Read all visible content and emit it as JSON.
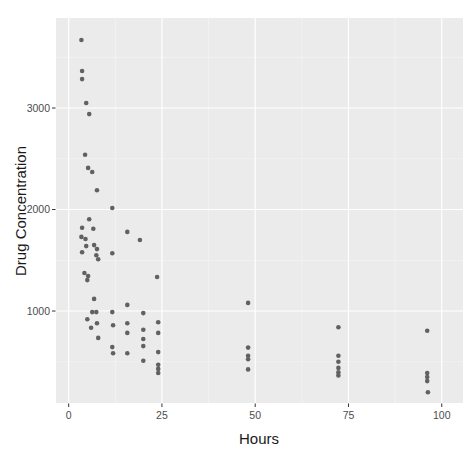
{
  "figure": {
    "background_color": "#ffffff"
  },
  "chart_data": {
    "type": "scatter",
    "title": "",
    "xlabel": "Hours",
    "ylabel": "Drug Concentration",
    "x_ticks": [
      0,
      25,
      50,
      75,
      100
    ],
    "y_ticks": [
      1000,
      2000,
      3000
    ],
    "xlim": [
      -3.4,
      105.7
    ],
    "ylim": [
      94,
      3887
    ],
    "grid": "major-and-minor",
    "legend": "none",
    "panel_bg": "#ebebeb",
    "grid_major_color": "#ffffff",
    "grid_minor_color": "#f7f7f7",
    "point_color": "#616161",
    "point_radius": 2.3,
    "tick_color": "#333333",
    "tick_label_color": "#4d4d4d",
    "axis_title_color": "#1a1a1a",
    "points": [
      [
        3.4,
        3670
      ],
      [
        3.6,
        3365
      ],
      [
        3.6,
        3285
      ],
      [
        4.7,
        3050
      ],
      [
        5.5,
        2940
      ],
      [
        4.4,
        2540
      ],
      [
        5.2,
        2410
      ],
      [
        6.3,
        2370
      ],
      [
        7.6,
        2190
      ],
      [
        11.7,
        2015
      ],
      [
        5.5,
        1905
      ],
      [
        3.6,
        1820
      ],
      [
        6.6,
        1810
      ],
      [
        3.4,
        1730
      ],
      [
        4.5,
        1710
      ],
      [
        15.7,
        1780
      ],
      [
        19.1,
        1700
      ],
      [
        4.7,
        1640
      ],
      [
        6.8,
        1650
      ],
      [
        3.6,
        1580
      ],
      [
        7.6,
        1610
      ],
      [
        7.4,
        1550
      ],
      [
        7.9,
        1510
      ],
      [
        11.7,
        1570
      ],
      [
        4.2,
        1375
      ],
      [
        5.2,
        1345
      ],
      [
        5.0,
        1305
      ],
      [
        23.7,
        1335
      ],
      [
        6.8,
        1120
      ],
      [
        15.7,
        1060
      ],
      [
        6.3,
        990
      ],
      [
        7.4,
        990
      ],
      [
        11.7,
        990
      ],
      [
        20.0,
        980
      ],
      [
        5.0,
        920
      ],
      [
        7.6,
        880
      ],
      [
        6.0,
        835
      ],
      [
        11.9,
        860
      ],
      [
        15.7,
        880
      ],
      [
        24.0,
        890
      ],
      [
        7.9,
        735
      ],
      [
        15.7,
        785
      ],
      [
        20.0,
        815
      ],
      [
        24.0,
        785
      ],
      [
        11.7,
        645
      ],
      [
        11.9,
        585
      ],
      [
        15.7,
        585
      ],
      [
        20.0,
        725
      ],
      [
        20.0,
        655
      ],
      [
        24.0,
        595
      ],
      [
        20.0,
        510
      ],
      [
        24.0,
        470
      ],
      [
        24.0,
        430
      ],
      [
        24.0,
        390
      ],
      [
        48.1,
        1080
      ],
      [
        48.1,
        640
      ],
      [
        48.1,
        560
      ],
      [
        48.1,
        525
      ],
      [
        48.1,
        425
      ],
      [
        72.3,
        840
      ],
      [
        72.3,
        560
      ],
      [
        72.3,
        500
      ],
      [
        72.3,
        440
      ],
      [
        72.3,
        395
      ],
      [
        72.3,
        365
      ],
      [
        96.1,
        805
      ],
      [
        96.1,
        390
      ],
      [
        96.1,
        350
      ],
      [
        96.1,
        310
      ],
      [
        96.3,
        200
      ]
    ]
  }
}
